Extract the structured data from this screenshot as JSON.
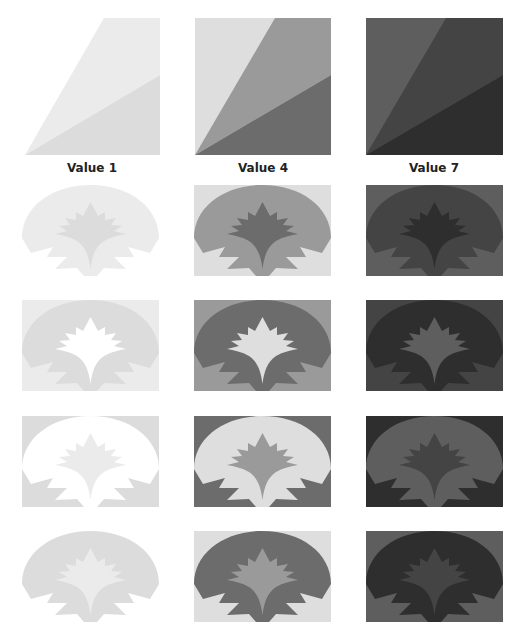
{
  "value_columns": [
    {
      "label": "Value 1",
      "scale": {
        "light": "#ffffff",
        "mid": "#ebebeb",
        "dark": "#dcdcdc"
      }
    },
    {
      "label": "Value 4",
      "scale": {
        "light": "#dedede",
        "mid": "#9a9a9a",
        "dark": "#6c6c6c"
      }
    },
    {
      "label": "Value 7",
      "scale": {
        "light": "#5e5e5e",
        "mid": "#444444",
        "dark": "#2e2e2e"
      }
    }
  ],
  "rows": [
    {
      "name": "row-1",
      "tiles": [
        {
          "background": "#ffffff",
          "dome": "#ebebeb",
          "flower": "#dcdcdc"
        },
        {
          "background": "#dedede",
          "dome": "#9a9a9a",
          "flower": "#6c6c6c"
        },
        {
          "background": "#5e5e5e",
          "dome": "#444444",
          "flower": "#2e2e2e"
        }
      ]
    },
    {
      "name": "row-2",
      "tiles": [
        {
          "background": "#ebebeb",
          "dome": "#dcdcdc",
          "flower": "#ffffff"
        },
        {
          "background": "#9a9a9a",
          "dome": "#6c6c6c",
          "flower": "#dedede"
        },
        {
          "background": "#444444",
          "dome": "#2e2e2e",
          "flower": "#5e5e5e"
        }
      ]
    },
    {
      "name": "row-3",
      "tiles": [
        {
          "background": "#dcdcdc",
          "dome": "#ffffff",
          "flower": "#ebebeb"
        },
        {
          "background": "#6c6c6c",
          "dome": "#dedede",
          "flower": "#9a9a9a"
        },
        {
          "background": "#2e2e2e",
          "dome": "#5e5e5e",
          "flower": "#444444"
        }
      ]
    },
    {
      "name": "row-4",
      "tiles": [
        {
          "background": "#ffffff",
          "dome": "#dcdcdc",
          "flower": "#ebebeb"
        },
        {
          "background": "#dedede",
          "dome": "#6c6c6c",
          "flower": "#9a9a9a"
        },
        {
          "background": "#5e5e5e",
          "dome": "#2e2e2e",
          "flower": "#444444"
        }
      ]
    }
  ]
}
